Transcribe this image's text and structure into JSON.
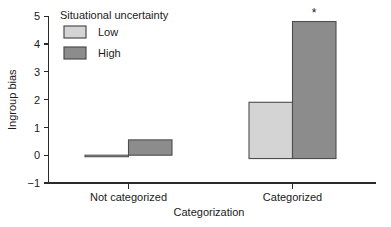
{
  "chart_data": {
    "type": "bar",
    "title": "",
    "xlabel": "Categorization",
    "ylabel": "Ingroup bias",
    "categories": [
      "Not categorized",
      "Categorized"
    ],
    "series": [
      {
        "name": "Low",
        "values": [
          -0.05,
          1.9
        ],
        "color": "#d4d4d4"
      },
      {
        "name": "High",
        "values": [
          0.55,
          4.8
        ],
        "color": "#8c8c8c"
      }
    ],
    "ylim": [
      -1,
      5
    ],
    "yticks": [
      -1,
      0,
      1,
      2,
      3,
      4,
      5
    ],
    "ytick_labels": [
      "−1",
      "0",
      "1",
      "2",
      "3",
      "4",
      "5"
    ],
    "xtick_labels": [
      "Not categorized",
      "Categorized"
    ],
    "grid": false,
    "legend": {
      "title": "Situational uncertainty",
      "position": "top-left-inside",
      "entries": [
        {
          "label": "Low",
          "color": "#d4d4d4"
        },
        {
          "label": "High",
          "color": "#8c8c8c"
        }
      ]
    },
    "annotations": [
      {
        "text": "*",
        "series": "High",
        "category": "Categorized",
        "meaning": "significant"
      }
    ]
  },
  "axis": {
    "y_title": "Ingroup bias",
    "x_title": "Categorization",
    "y_tick_0": "5",
    "y_tick_1": "4",
    "y_tick_2": "3",
    "y_tick_3": "2",
    "y_tick_4": "1",
    "y_tick_5": "0",
    "y_tick_6": "−1"
  },
  "legend": {
    "title": "Situational uncertainty",
    "low_label": "Low",
    "high_label": "High"
  },
  "xcat": {
    "left": "Not categorized",
    "right": "Categorized"
  },
  "annotation": {
    "star": "*"
  },
  "colors": {
    "low_fill": "#d4d4d4",
    "high_fill": "#8c8c8c",
    "bar_stroke": "#4d4d4d",
    "axis": "#2a2a2a",
    "text": "#1a1a1a",
    "background": "#ffffff"
  }
}
